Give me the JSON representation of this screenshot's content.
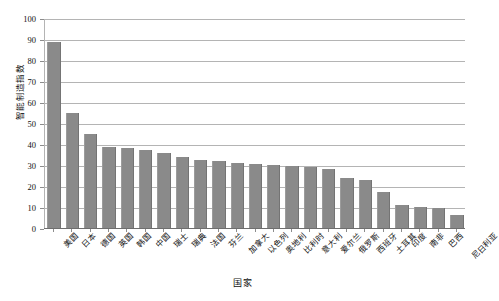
{
  "chart_data": {
    "type": "bar",
    "title": "",
    "xlabel": "国家",
    "ylabel": "智能制造指数",
    "ylim": [
      0,
      100
    ],
    "ytick_step": 10,
    "ytick_labels": [
      "0",
      "10",
      "20",
      "30",
      "40",
      "50",
      "60",
      "70",
      "80",
      "90",
      "100"
    ],
    "grid": true,
    "legend": "none",
    "bar_color": "#8a8a8a",
    "gridline_color": "#b4b4b4",
    "axis_color": "#6e6e6e",
    "categories": [
      "美国",
      "日本",
      "德国",
      "英国",
      "韩国",
      "中国",
      "瑞士",
      "瑞典",
      "法国",
      "芬兰",
      "加拿大",
      "以色列",
      "奥地利",
      "比利时",
      "意大利",
      "爱尔兰",
      "俄罗斯",
      "西班牙",
      "土耳其",
      "印度",
      "南非",
      "巴西",
      "尼日利亚"
    ],
    "values": [
      89,
      55,
      45,
      39,
      38.5,
      37.5,
      36,
      34,
      32.5,
      32,
      31,
      30.5,
      30,
      29.5,
      29,
      28,
      24,
      23,
      17,
      11,
      10,
      9.5,
      6
    ]
  }
}
